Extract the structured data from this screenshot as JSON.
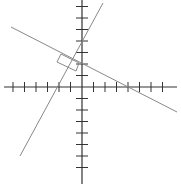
{
  "diagram": {
    "type": "coordinate-plane",
    "colors": {
      "axis": "#333333",
      "line": "#888888",
      "background": "#ffffff"
    },
    "origin_px": [
      82,
      87
    ],
    "tick_spacing_px": 11.5,
    "x_ticks_left": 6,
    "x_ticks_right": 7,
    "y_ticks_up": 7,
    "y_ticks_down": 7,
    "lines": [
      {
        "name": "steep-line",
        "from": [
          20,
          156
        ],
        "to": [
          103,
          3
        ]
      },
      {
        "name": "shallow-line",
        "from": [
          11,
          27
        ],
        "to": [
          177,
          112
        ]
      }
    ],
    "right_angle_marker": [
      [
        57,
        62
      ],
      [
        61,
        54
      ],
      [
        79,
        63
      ],
      [
        76,
        71
      ]
    ]
  }
}
